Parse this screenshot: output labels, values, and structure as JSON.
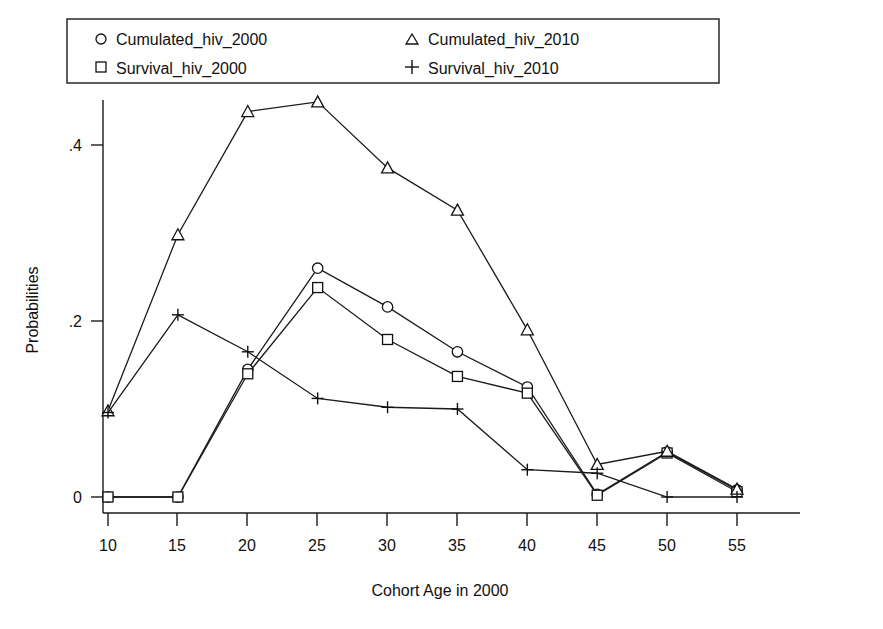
{
  "chart_data": {
    "type": "line",
    "title": "",
    "xlabel": "Cohort Age in 2000",
    "ylabel": "Probabilities",
    "x": [
      10,
      15,
      20,
      25,
      30,
      35,
      40,
      45,
      50,
      55
    ],
    "xticklabels": [
      "10",
      "15",
      "20",
      "25",
      "30",
      "35",
      "40",
      "45",
      "50",
      "55"
    ],
    "yticks": [
      0,
      0.2,
      0.4
    ],
    "yticklabels": [
      "0",
      ".2",
      ".4"
    ],
    "xlim": [
      8.5,
      56.5
    ],
    "ylim": [
      -0.012,
      0.47
    ],
    "grid": false,
    "legend_position": "top-left-outside-two-columns",
    "series": [
      {
        "name": "Cumulated_hiv_2000",
        "marker": "circle",
        "values": [
          0.0,
          0.0,
          0.145,
          0.26,
          0.216,
          0.165,
          0.125,
          0.003,
          0.051,
          0.008
        ]
      },
      {
        "name": "Survival_hiv_2000",
        "marker": "square",
        "values": [
          0.0,
          0.0,
          0.14,
          0.238,
          0.179,
          0.137,
          0.118,
          0.002,
          0.05,
          0.006
        ]
      },
      {
        "name": "Cumulated_hiv_2010",
        "marker": "triangle",
        "values": [
          0.098,
          0.298,
          0.438,
          0.449,
          0.374,
          0.326,
          0.19,
          0.037,
          0.052,
          0.009
        ]
      },
      {
        "name": "Survival_hiv_2010",
        "marker": "plus",
        "values": [
          0.096,
          0.207,
          0.165,
          0.112,
          0.102,
          0.1,
          0.031,
          0.027,
          0.0,
          0.0
        ]
      }
    ]
  },
  "legend": {
    "entries": [
      {
        "marker": "circle-icon",
        "label": "Cumulated_hiv_2000"
      },
      {
        "marker": "triangle-icon",
        "label": "Cumulated_hiv_2010"
      },
      {
        "marker": "square-icon",
        "label": "Survival_hiv_2000"
      },
      {
        "marker": "plus-icon",
        "label": "Survival_hiv_2010"
      }
    ]
  },
  "axes": {
    "y_title": "Probabilities",
    "x_title": "Cohort Age in 2000",
    "y_tick_0": "0",
    "y_tick_1": ".2",
    "y_tick_2": ".4",
    "x_tick_0": "10",
    "x_tick_1": "15",
    "x_tick_2": "20",
    "x_tick_3": "25",
    "x_tick_4": "30",
    "x_tick_5": "35",
    "x_tick_6": "40",
    "x_tick_7": "45",
    "x_tick_8": "50",
    "x_tick_9": "55"
  },
  "colors": {
    "ink": "#111111",
    "background": "#ffffff"
  }
}
